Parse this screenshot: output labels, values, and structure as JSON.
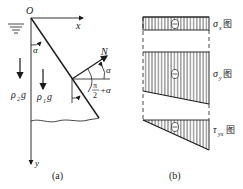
{
  "panel_a": {
    "caption": "(a)",
    "origin_label": "O",
    "x_axis_label": "x",
    "y_axis_label": "y",
    "angle_label": "α",
    "normal_label": "N",
    "normal_angle_label": "α",
    "angle_expr_num": "π",
    "angle_expr_den": "2",
    "angle_expr_tail": "+α",
    "fluid_weight_label": "ρ",
    "fluid_weight_sub": "2",
    "fluid_weight_g": "g",
    "body_weight_label": "ρ",
    "body_weight_sub": "1",
    "body_weight_g": "g"
  },
  "panel_b": {
    "caption": "(b)",
    "diagrams": [
      {
        "symbol": "σ",
        "sub": "x",
        "suffix": "图",
        "sign": "⊖"
      },
      {
        "symbol": "σ",
        "sub": "y",
        "suffix": "图",
        "sign": "⊖"
      },
      {
        "symbol": "τ",
        "sub": "yx",
        "suffix": "图",
        "sign": "⊖"
      }
    ]
  },
  "colors": {
    "line": "#1a1a1a",
    "background": "#ffffff"
  }
}
